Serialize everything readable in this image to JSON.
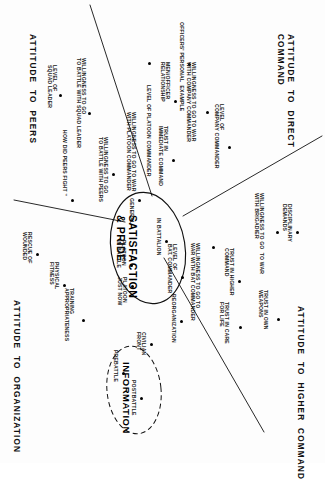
{
  "figure": {
    "kind": "concept-map",
    "orientation_deg": 90,
    "ink_color": "#111111"
  },
  "axis_labels": [
    {
      "name": "attitude-to-peers",
      "text": "ATTITUDE  TO  PEERS"
    },
    {
      "name": "attitude-to-direct-command",
      "text": "ATTITUDE  TO  DIRECT\nCOMMAND"
    },
    {
      "name": "attitude-to-organization",
      "text": "ATTITUDE  TO  ORGANIZATION"
    },
    {
      "name": "attitude-to-higher-command",
      "text": "ATTITUDE  TO  HIGHER  COMMAND"
    }
  ],
  "clusters": [
    {
      "name": "satisfaction-and-pride",
      "title": "SATISFACTION\n& PRIDE",
      "style": "solid-ellipse"
    },
    {
      "name": "information",
      "title": "INFORMATION",
      "style": "dashed-ellipse"
    }
  ],
  "nodes": [
    {
      "id": "n01",
      "label": "LEVEL OF\nSQUAD LEADER"
    },
    {
      "id": "n02",
      "label": "WILLINGNESS TO GO\nTO BATTLE WITH SQUAD LEADER"
    },
    {
      "id": "n03",
      "label": "HOW DID PEERS FIGHT \""
    },
    {
      "id": "n04",
      "label": "WILLINGNESS TO GO\nTO BATTLE WITH PEERS"
    },
    {
      "id": "n05",
      "label": "WILLINGNESS TO GO TO WAR\nWITH PLATOON COMMANDER"
    },
    {
      "id": "n06",
      "label": "LEVEL OF PLATOON COMMANDER"
    },
    {
      "id": "n07",
      "label": "MEN/OFFICER\nRELATIONSHIP"
    },
    {
      "id": "n08",
      "label": "OFFICERS' PERSONAL  EXAMPLE"
    },
    {
      "id": "n09",
      "label": "WILLINGNESS TO GO TO WAR\nWITH COMPANY COMMANDER"
    },
    {
      "id": "n10",
      "label": "LEVEL OF\nCOMPANY COMMANDER"
    },
    {
      "id": "n11",
      "label": "TRUST IN\nIMMEDIATE COMMAND"
    },
    {
      "id": "n12",
      "label": "GENERAL"
    },
    {
      "id": "n13",
      "label": "PLATOON\nIN BATTLE"
    },
    {
      "id": "n14",
      "label": "PLATOON\nJUST NOW"
    },
    {
      "id": "n15",
      "label": "IN BATTALION"
    },
    {
      "id": "n16",
      "label": "LEVEL OF\nBAT. COMMANDER"
    },
    {
      "id": "n17",
      "label": "WILLINGNESS TO GO TO\nWAR WITH BAT COMMANDER"
    },
    {
      "id": "n18",
      "label": "RESCUE OF\nWOUNDED"
    },
    {
      "id": "n19",
      "label": "PHYSICAL\nFITNESS"
    },
    {
      "id": "n20",
      "label": "TRAINING\nAPPROPRIATENESS"
    },
    {
      "id": "n21",
      "label": "REORGANIZATION"
    },
    {
      "id": "n22",
      "label": "PREBATTLE"
    },
    {
      "id": "n23",
      "label": "POSTBATTLE"
    },
    {
      "id": "n24",
      "label": "CIVILIAN\nFRONT"
    },
    {
      "id": "n25",
      "label": "TRUST IN CARE\nFOR LIFE"
    },
    {
      "id": "n26",
      "label": "TRUST IN HIGHER\nCOMMAND"
    },
    {
      "id": "n27",
      "label": "TRUST IN OWN\nWEAPONS"
    },
    {
      "id": "n28",
      "label": "WILLINGNESS TO GO  TO WAR\nWITH BRIGADIER"
    },
    {
      "id": "n29",
      "label": "DISCIPLINARY\nDEMANDS"
    }
  ]
}
